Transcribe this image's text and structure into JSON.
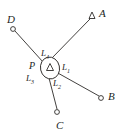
{
  "figure": {
    "width": 123,
    "height": 140,
    "background": "#ffffff",
    "ink_color": "#2e2b29",
    "text_color": "#231f1e"
  },
  "center_node": {
    "label": "P",
    "label_x": 29,
    "label_y": 61,
    "marker": "triangle-in-ellipse",
    "x": 50,
    "y": 68,
    "ring_rx": 9.5,
    "ring_ry": 11,
    "ring_rotation": -12,
    "triangle_size": 6
  },
  "vertices": [
    {
      "id": "A",
      "label": "A",
      "marker": "triangle",
      "x": 92,
      "y": 16,
      "label_x": 99,
      "label_y": 8,
      "marker_size": 5
    },
    {
      "id": "B",
      "label": "B",
      "marker": "circle",
      "x": 101,
      "y": 98,
      "label_x": 108,
      "label_y": 91,
      "marker_size": 2.4
    },
    {
      "id": "C",
      "label": "C",
      "marker": "circle",
      "x": 57,
      "y": 112,
      "label_x": 56,
      "label_y": 120,
      "marker_size": 2.4
    },
    {
      "id": "D",
      "label": "D",
      "marker": "circle",
      "x": 13,
      "y": 29,
      "label_x": 7,
      "label_y": 14,
      "marker_size": 2.4
    }
  ],
  "edges": [
    {
      "id": "L1",
      "label": "L",
      "subscript": "1",
      "from": "P",
      "to": "B",
      "x1": 56,
      "y1": 72,
      "x2": 99,
      "y2": 96,
      "label_x": 62,
      "label_y": 63
    },
    {
      "id": "L2",
      "label": "L",
      "subscript": "2",
      "from": "P",
      "to": "C",
      "x1": 49,
      "y1": 78,
      "x2": 57,
      "y2": 109,
      "label_x": 53,
      "label_y": 79
    },
    {
      "id": "L3",
      "label": "L",
      "subscript": "3",
      "from": "P",
      "to": "D",
      "x1": 43,
      "y1": 62,
      "x2": 15,
      "y2": 31,
      "label_x": 26,
      "label_y": 74
    },
    {
      "id": "L4",
      "label": "L",
      "subscript": "4",
      "from": "P",
      "to": "A",
      "x1": 52,
      "y1": 58,
      "x2": 90,
      "y2": 19,
      "label_x": 41,
      "label_y": 49
    }
  ]
}
